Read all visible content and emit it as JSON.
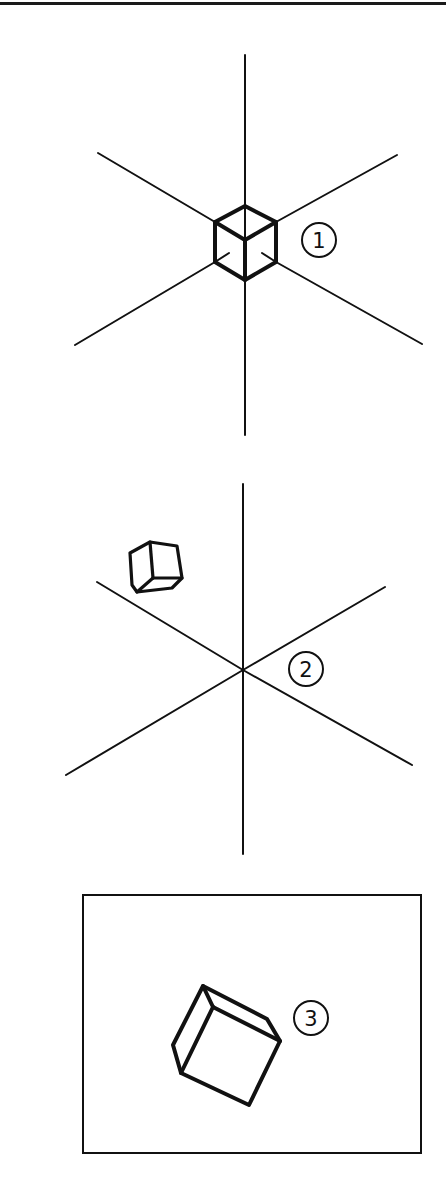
{
  "figure": {
    "colors": {
      "ink": "#111111",
      "background": "#ffffff"
    },
    "panels": [
      {
        "id": "1",
        "label": "1",
        "label_pos": {
          "cx": 319,
          "cy": 240,
          "r": 17
        },
        "axes": {
          "vertical": [
            [
              245,
              55
            ],
            [
              245,
              435
            ]
          ],
          "upper_left": [
            [
              98,
              153
            ],
            [
              245,
              240
            ]
          ],
          "upper_right": [
            [
              397,
              155
            ],
            [
              245,
              240
            ]
          ],
          "lower_left": [
            [
              75,
              345
            ],
            [
              245,
              240
            ]
          ],
          "lower_right": [
            [
              422,
              344
            ],
            [
              245,
              240
            ]
          ]
        },
        "cube_points": "245,206 276,222 276,262 245,280 215,262 215,222",
        "cube_inner": [
          [
            215,
            222,
            245,
            240
          ],
          [
            276,
            222,
            245,
            240
          ],
          [
            245,
            240,
            245,
            280
          ]
        ]
      },
      {
        "id": "2",
        "label": "2",
        "label_pos": {
          "cx": 306,
          "cy": 669,
          "r": 17
        },
        "axes": {
          "vertical": [
            [
              243,
              484
            ],
            [
              243,
              854
            ]
          ],
          "upper_left": [
            [
              97,
              582
            ],
            [
              243,
              670
            ]
          ],
          "upper_right": [
            [
              385,
              587
            ],
            [
              243,
              670
            ]
          ],
          "lower_left": [
            [
              66,
              775
            ],
            [
              243,
              670
            ]
          ],
          "lower_right": [
            [
              412,
              765
            ],
            [
              243,
              670
            ]
          ]
        },
        "cube_points": "130,553 150,542 177,546 182,578 172,588 137,592 132,585",
        "cube_inner": [
          [
            150,
            542,
            153,
            578
          ],
          [
            153,
            578,
            182,
            578
          ],
          [
            153,
            578,
            137,
            592
          ]
        ]
      },
      {
        "id": "3",
        "label": "3",
        "label_pos": {
          "cx": 311,
          "cy": 1018,
          "r": 17
        },
        "frame": {
          "x": 83,
          "y": 895,
          "w": 338,
          "h": 258
        },
        "cube_points": "203,986 267,1019 280,1041 249,1105 181,1073 173,1045",
        "cube_inner": [
          [
            203,
            986,
            213,
            1007
          ],
          [
            213,
            1007,
            280,
            1041
          ],
          [
            213,
            1007,
            181,
            1073
          ]
        ]
      }
    ]
  }
}
